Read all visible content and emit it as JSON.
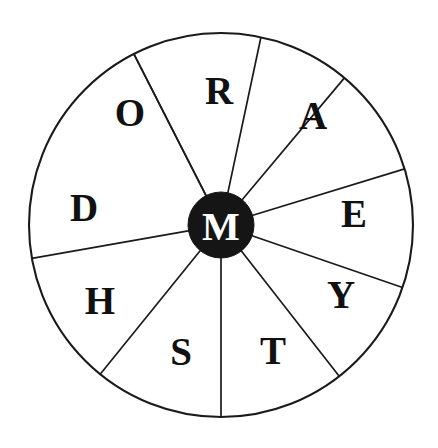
{
  "puzzle": {
    "type": "word-wheel",
    "title": "Word Wheel",
    "center_letter": "M",
    "outer_letters": [
      "R",
      "A",
      "E",
      "Y",
      "T",
      "S",
      "H",
      "D",
      "O"
    ],
    "sector_count": 9,
    "colors": {
      "background": "#ffffff",
      "line": "#1a1a1a",
      "hub_fill": "#151515",
      "hub_text": "#ffffff",
      "letter": "#111111"
    },
    "geometry": {
      "center_x": 221,
      "center_y": 225,
      "outer_radius": 192,
      "hub_radius": 33,
      "letter_radius": 120
    },
    "sectors": [
      {
        "letter": "O",
        "x": 130,
        "y": 112,
        "start_angle": -117,
        "end_angle": -78
      },
      {
        "letter": "R",
        "x": 219,
        "y": 90,
        "start_angle": -78,
        "end_angle": -50
      },
      {
        "letter": "A",
        "x": 313,
        "y": 115,
        "start_angle": -50,
        "end_angle": -17
      },
      {
        "letter": "E",
        "x": 354,
        "y": 213,
        "start_angle": -17,
        "end_angle": 19
      },
      {
        "letter": "Y",
        "x": 341,
        "y": 294,
        "start_angle": 19,
        "end_angle": 52
      },
      {
        "letter": "T",
        "x": 273,
        "y": 350,
        "start_angle": 52,
        "end_angle": 90
      },
      {
        "letter": "S",
        "x": 181,
        "y": 351,
        "start_angle": 90,
        "end_angle": 129
      },
      {
        "letter": "H",
        "x": 100,
        "y": 300,
        "start_angle": 129,
        "end_angle": 170
      },
      {
        "letter": "D",
        "x": 84,
        "y": 207,
        "start_angle": 170,
        "end_angle": 243
      }
    ],
    "hub": {
      "letter": "M",
      "x": 221,
      "y": 225
    }
  }
}
